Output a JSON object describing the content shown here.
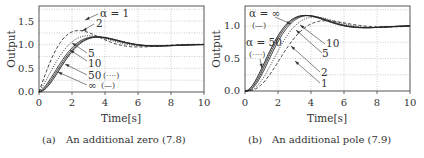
{
  "chart_data": [
    {
      "id": "a",
      "type": "line",
      "title": "",
      "caption_label": "(a)",
      "caption": "An additional zero (7.8)",
      "xlabel": "Time[s]",
      "ylabel": "Output",
      "xlim": [
        0,
        10
      ],
      "ylim": [
        0,
        1.8
      ],
      "xticks": [
        "0",
        "2",
        "4",
        "6",
        "8",
        "10"
      ],
      "yticks": [
        "0.0",
        "0.5",
        "1.0",
        "1.5"
      ],
      "grid": true,
      "model": "G(s) = (s/alpha + 1) / (s^2 + s + 1)",
      "series": [
        {
          "name": "α = 1",
          "alpha": 1,
          "style": "dashed",
          "peak": 1.7,
          "peak_time": 1.8
        },
        {
          "name": "2",
          "alpha": 2,
          "style": "dotted",
          "peak": 1.3,
          "peak_time": 2.6
        },
        {
          "name": "5",
          "alpha": 5,
          "style": "solid",
          "peak": 1.19,
          "peak_time": 3.2
        },
        {
          "name": "10",
          "alpha": 10,
          "style": "solid",
          "peak": 1.18,
          "peak_time": 3.4
        },
        {
          "name": "50 (····)",
          "alpha": 50,
          "style": "dotted",
          "peak": 1.17,
          "peak_time": 3.6
        },
        {
          "name": "∞ (—)",
          "alpha": "inf",
          "style": "solid",
          "peak": 1.16,
          "peak_time": 3.6
        }
      ],
      "annotations": [
        "α = 1",
        "2",
        "5",
        "10",
        "50",
        "(····)",
        "∞",
        "(—)"
      ],
      "final_value": 1.0
    },
    {
      "id": "b",
      "type": "line",
      "title": "",
      "caption_label": "(b)",
      "caption": "An additional pole (7.9)",
      "xlabel": "Time[s]",
      "ylabel": "Output",
      "xlim": [
        0,
        10
      ],
      "ylim": [
        0,
        1.3
      ],
      "xticks": [
        "0",
        "2",
        "4",
        "6",
        "8",
        "10"
      ],
      "yticks": [
        "0.0",
        "0.5",
        "1.0"
      ],
      "grid": true,
      "model": "G(s) = 1 / ((s/alpha + 1)(s^2 + s + 1))",
      "series": [
        {
          "name": "α = ∞ (—)",
          "alpha": "inf",
          "style": "solid",
          "peak": 1.16,
          "peak_time": 3.6
        },
        {
          "name": "α = 50 (····)",
          "alpha": 50,
          "style": "dotted",
          "peak": 1.16,
          "peak_time": 3.7
        },
        {
          "name": "10",
          "alpha": 10,
          "style": "solid",
          "peak": 1.16,
          "peak_time": 3.8
        },
        {
          "name": "5",
          "alpha": 5,
          "style": "solid",
          "peak": 1.15,
          "peak_time": 4.0
        },
        {
          "name": "2",
          "alpha": 2,
          "style": "dotted",
          "peak": 1.11,
          "peak_time": 4.4
        },
        {
          "name": "1",
          "alpha": 1,
          "style": "dashed",
          "peak": 1.06,
          "peak_time": 5.2
        }
      ],
      "annotations": [
        "α = ∞",
        "(—)",
        "α = 50",
        "(····)",
        "10",
        "5",
        "2",
        "1"
      ],
      "final_value": 1.0
    }
  ],
  "labels": {
    "a": {
      "alpha1": "α = 1",
      "a2": "2",
      "a5": "5",
      "a10": "10",
      "a50": "50",
      "a50style": "(····)",
      "ainf": "∞",
      "ainfstyle": "(—)"
    },
    "b": {
      "ainf": "α = ∞",
      "ainfstyle": "(—)",
      "a50": "α = 50",
      "a50style": "(····)",
      "a10": "10",
      "a5": "5",
      "a2": "2",
      "a1": "1"
    }
  }
}
